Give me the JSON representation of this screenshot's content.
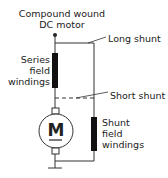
{
  "diagram": {
    "title_line1": "Compound wound",
    "title_line2": "DC motor",
    "labels": {
      "long_shunt": "Long shunt",
      "short_shunt": "Short shunt",
      "series_line1": "Series",
      "series_line2": "field",
      "series_line3": "windings",
      "shunt_line1": "Shunt",
      "shunt_line2": "field",
      "shunt_line3": "windings"
    },
    "motor_symbol": "M",
    "colors": {
      "line": "#333333",
      "winding": "#111111",
      "background": "#ffffff"
    }
  }
}
